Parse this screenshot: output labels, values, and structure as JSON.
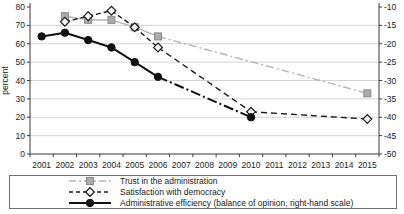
{
  "chart_data": {
    "type": "line",
    "x": [
      "2001",
      "2002",
      "2003",
      "2004",
      "2005",
      "2006",
      "2007",
      "2008",
      "2009",
      "2010",
      "2011",
      "2012",
      "2013",
      "2014",
      "2015"
    ],
    "left_axis": {
      "label": "percent",
      "min": 0,
      "max": 80,
      "ticks": [
        0,
        10,
        20,
        30,
        40,
        50,
        60,
        70,
        80
      ]
    },
    "right_axis": {
      "min": -50,
      "max": -10,
      "ticks": [
        -50,
        -45,
        -40,
        -35,
        -30,
        -25,
        -20,
        -15,
        -10
      ]
    },
    "grid": "horizontal",
    "legend_position": "bottom",
    "colors": {
      "gridline": "#c9c9c9",
      "axis": "#3a3a3a",
      "background": "#ffffff"
    },
    "series": [
      {
        "name": "Trust in the administration",
        "axis": "left_axis",
        "marker": "square",
        "color": "#b5b5b5",
        "marker_fill": "#ababab",
        "marker_stroke": "#8a8a8a",
        "width": 1.4,
        "dash": "",
        "gap_dash": "8 3 2 3",
        "legend_dash": "7 3 2 3",
        "values": [
          null,
          75,
          73,
          73,
          69,
          64,
          null,
          null,
          null,
          null,
          null,
          null,
          null,
          null,
          33
        ]
      },
      {
        "name": "Satisfaction with democracy",
        "axis": "left_axis",
        "marker": "diamond",
        "color": "#1a1a1a",
        "marker_fill": "#f4f4f4",
        "marker_stroke": "#1a1a1a",
        "width": 1.4,
        "dash": "5 3",
        "gap_dash": "6 4",
        "legend_dash": "4 3",
        "values": [
          null,
          72,
          75,
          78,
          69,
          58,
          null,
          null,
          null,
          23,
          null,
          null,
          null,
          null,
          19
        ]
      },
      {
        "name": "Administrative efficiency (balance of opinion, right-hand scale)",
        "axis": "right_axis",
        "marker": "circle",
        "color": "#111111",
        "marker_fill": "#111111",
        "marker_stroke": "#111111",
        "width": 2,
        "dash": "",
        "gap_dash": "10 3 2 3",
        "legend_dash": "",
        "values": [
          -18,
          -17,
          -19,
          -21,
          -25,
          -29,
          null,
          null,
          null,
          -40,
          null,
          null,
          null,
          null,
          null
        ]
      }
    ]
  }
}
